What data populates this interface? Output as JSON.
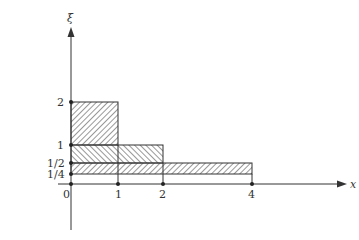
{
  "figure": {
    "x_axis_label": "x",
    "y_axis_label": "ξ",
    "origin_label": "0",
    "x_ticks": [
      {
        "value": 1,
        "label": "1",
        "px": 118
      },
      {
        "value": 2,
        "label": "2",
        "px": 163
      },
      {
        "value": 4,
        "label": "4",
        "px": 252
      }
    ],
    "y_ticks": [
      {
        "value": 2,
        "label": "2",
        "py": 102
      },
      {
        "value": 1,
        "label": "1",
        "py": 145
      },
      {
        "value": 0.5,
        "label": "1/2",
        "py": 163
      },
      {
        "value": 0.25,
        "label": "1/4",
        "py": 174
      }
    ],
    "regions": [
      {
        "x_range": [
          0,
          1
        ],
        "y_range": [
          1,
          2
        ],
        "hatch": "forward-diagonal"
      },
      {
        "x_range": [
          0,
          2
        ],
        "y_range": [
          0.5,
          1
        ],
        "hatch": "backward-diagonal"
      },
      {
        "x_range": [
          0,
          4
        ],
        "y_range": [
          0.25,
          0.5
        ],
        "hatch": "forward-diagonal"
      }
    ],
    "colors": {
      "line": "#333333",
      "background": "#ffffff"
    }
  }
}
